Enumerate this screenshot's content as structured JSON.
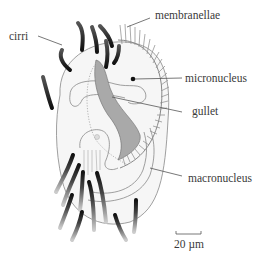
{
  "diagram": {
    "labels": {
      "cirri": "cirri",
      "membranellae": "membranellae",
      "micronucleus": "micronucleus",
      "gullet": "gullet",
      "macronucleus": "macronucleus"
    },
    "scale_bar": {
      "label": "20 µm"
    },
    "colors": {
      "body_fill": "#f6f6f6",
      "outline": "#777777",
      "gullet_fill": "#a9a9a9",
      "cirri_dark": "#3b3b3b",
      "text": "#3a3a3a"
    }
  }
}
